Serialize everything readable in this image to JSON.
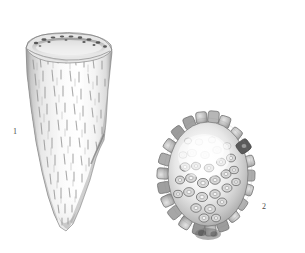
{
  "plate": {
    "title": "Fossil specimen plate",
    "background_color": "#ffffff",
    "width": 305,
    "height": 253,
    "style": "grayscale halftone scientific illustration",
    "figures": [
      {
        "number": "1",
        "label_text": "1",
        "name": "conical-specimen",
        "description": "Elongate conical fossil tapering to a rounded point, with elliptical apertural rim at top and fine vertical dash-like striations over the surface",
        "orientation": "lateral view, apex down",
        "bounds": {
          "x": 22,
          "y": 33,
          "width": 90,
          "height": 197
        },
        "label_position": {
          "x": 13,
          "y": 128
        },
        "colors": {
          "body_light": "#fafafa",
          "body_mid": "#d8d8d8",
          "shadow": "#9a9a9a",
          "outline": "#6e6e6e",
          "rim_dark": "#4a4a4a"
        }
      },
      {
        "number": "2",
        "label_text": "2",
        "name": "tuberculate-ovoid-specimen",
        "description": "Ovoid fossil test covered with ring-shaped tubercles giving a crenulate spiny outline; pale bleached centre with darker tubercles toward the margin",
        "orientation": "apertural / umbilical view",
        "bounds": {
          "x": 162,
          "y": 115,
          "width": 96,
          "height": 125
        },
        "label_position": {
          "x": 262,
          "y": 203
        },
        "colors": {
          "body_light": "#f2f2f2",
          "body_mid": "#c4c4c4",
          "shadow": "#8d8d8d",
          "outline": "#6a6a6a",
          "tubercle_dark": "#555555"
        }
      }
    ]
  }
}
